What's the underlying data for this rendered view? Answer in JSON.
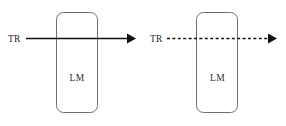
{
  "figure": {
    "background_color": "#ffffff",
    "width": 286,
    "height": 126,
    "panels": [
      {
        "id": "left-panel",
        "box_label": "LM",
        "input_label": "TR",
        "flow_style": "solid",
        "arrow_direction": "right",
        "box": {
          "x": 56,
          "y": 12,
          "width": 41,
          "height": 101,
          "radius": 7
        },
        "line": {
          "x1": 26,
          "y1": 38,
          "x2": 128,
          "y2": 38
        },
        "arrow_tip_x": 136,
        "label_pos": {
          "x": 8,
          "y": 41
        },
        "box_label_pos": {
          "x": 76.5,
          "y": 80
        },
        "stroke_color": "#111111",
        "box_stroke_color": "#6f6f6f"
      },
      {
        "id": "right-panel",
        "box_label": "LM",
        "input_label": "TR",
        "flow_style": "dashed",
        "arrow_direction": "right",
        "box": {
          "x": 196,
          "y": 12,
          "width": 42,
          "height": 101,
          "radius": 7
        },
        "line": {
          "x1": 167,
          "y1": 38,
          "x2": 269,
          "y2": 38
        },
        "arrow_tip_x": 277,
        "label_pos": {
          "x": 150,
          "y": 41
        },
        "box_label_pos": {
          "x": 217,
          "y": 80
        },
        "stroke_color": "#111111",
        "box_stroke_color": "#6f6f6f"
      }
    ]
  },
  "labels": {
    "left_input": "TR",
    "left_box": "LM",
    "right_input": "TR",
    "right_box": "LM"
  }
}
